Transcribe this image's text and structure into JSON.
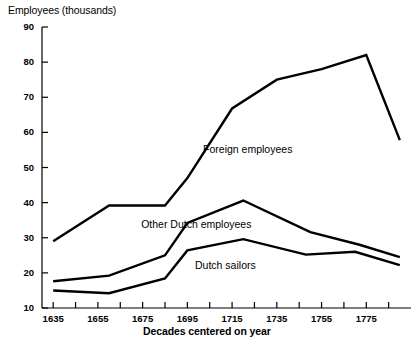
{
  "chart_data": {
    "type": "line",
    "title": "",
    "ylabel": "Employees (thousands)",
    "xlabel": "Decades centered on year",
    "ylim": [
      10,
      90
    ],
    "ytick_labels": [
      "90",
      "80",
      "70",
      "60",
      "50",
      "40",
      "30",
      "20",
      "10"
    ],
    "ytick_values": [
      90,
      80,
      70,
      60,
      50,
      40,
      30,
      20,
      10
    ],
    "xlim": [
      1630,
      1795
    ],
    "xtick_labels": [
      "1635",
      "1655",
      "1675",
      "1695",
      "1715",
      "1735",
      "1755",
      "1775"
    ],
    "xtick_values": [
      1635,
      1655,
      1675,
      1695,
      1715,
      1735,
      1755,
      1775
    ],
    "xminor_step": 10,
    "grid": false,
    "legend": "inline-annotations",
    "series": [
      {
        "name": "Foreign employees",
        "label_x": 1722,
        "label_y": 55,
        "x": [
          1635,
          1660,
          1685,
          1695,
          1715,
          1735,
          1755,
          1775,
          1790
        ],
        "values": [
          29.0,
          39.2,
          39.2,
          47.0,
          66.8,
          75.0,
          78.0,
          82.0,
          57.8
        ]
      },
      {
        "name": "Other Dutch employees",
        "label_x": 1699,
        "label_y": 33.5,
        "x": [
          1635,
          1660,
          1685,
          1695,
          1720,
          1750,
          1772,
          1790
        ],
        "values": [
          17.6,
          19.2,
          25.0,
          34.2,
          40.6,
          31.6,
          28.0,
          24.5
        ]
      },
      {
        "name": "Dutch sailors",
        "label_x": 1712,
        "label_y": 22.0,
        "x": [
          1635,
          1660,
          1685,
          1695,
          1720,
          1748,
          1770,
          1790
        ],
        "values": [
          15.0,
          14.2,
          18.4,
          26.4,
          29.6,
          25.2,
          26.0,
          22.2
        ]
      }
    ],
    "colors": {
      "line": "#000000",
      "background": "#ffffff",
      "axis": "#000000"
    }
  }
}
